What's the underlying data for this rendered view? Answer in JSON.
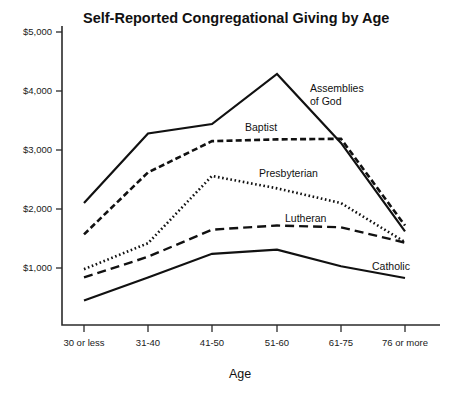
{
  "chart_data": {
    "type": "line",
    "title": "Self-Reported Congregational Giving by Age",
    "xlabel": "Age",
    "ylabel": "",
    "categories": [
      "30 or less",
      "31-40",
      "41-50",
      "51-60",
      "61-75",
      "76 or more"
    ],
    "ylim": [
      0,
      5000
    ],
    "yticks": [
      1000,
      2000,
      3000,
      4000,
      5000
    ],
    "ytick_labels": [
      "$1,000",
      "$2,000",
      "$3,000",
      "$4,000",
      "$5,000"
    ],
    "grid": false,
    "legend_position": "inline-annotations",
    "series": [
      {
        "name": "Assemblies of God",
        "style": "solid",
        "values": [
          2100,
          3280,
          3440,
          4290,
          3120,
          1620
        ]
      },
      {
        "name": "Baptist",
        "style": "dashed-short",
        "values": [
          1570,
          2620,
          3150,
          3180,
          3190,
          1720
        ]
      },
      {
        "name": "Presbyterian",
        "style": "dotted",
        "values": [
          980,
          1420,
          2560,
          2350,
          2100,
          1440
        ]
      },
      {
        "name": "Lutheran",
        "style": "dashed-long",
        "values": [
          840,
          1190,
          1650,
          1720,
          1690,
          1430
        ]
      },
      {
        "name": "Catholic",
        "style": "solid",
        "values": [
          450,
          840,
          1240,
          1310,
          1030,
          830
        ]
      }
    ],
    "annotations": [
      {
        "text_line1": "Assemblies",
        "text_line2": "of God",
        "x": 310,
        "y": 92
      },
      {
        "text_line1": "Baptist",
        "text_line2": "",
        "x": 245,
        "y": 131
      },
      {
        "text_line1": "Presbyterian",
        "text_line2": "",
        "x": 259,
        "y": 177
      },
      {
        "text_line1": "Lutheran",
        "text_line2": "",
        "x": 285,
        "y": 222
      },
      {
        "text_line1": "Catholic",
        "text_line2": "",
        "x": 372,
        "y": 270
      }
    ]
  },
  "colors": {
    "ink": "#111111",
    "axis": "#2b2b2b",
    "background": "#ffffff"
  }
}
